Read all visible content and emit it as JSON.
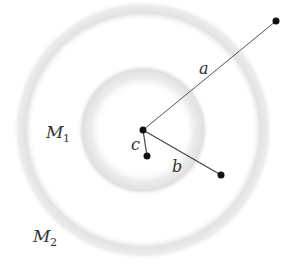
{
  "diagram": {
    "center": {
      "x": 143,
      "y": 130
    },
    "shells": [
      {
        "id": "M1",
        "radius": 52,
        "thickness": 22,
        "label": "M",
        "subscript": "1",
        "label_x": 47,
        "label_y": 138
      },
      {
        "id": "M2",
        "radius": 117,
        "thickness": 18,
        "label": "M",
        "subscript": "2",
        "label_x": 34,
        "label_y": 242
      }
    ],
    "points": [
      {
        "name": "a",
        "x": 276,
        "y": 21,
        "label": "a",
        "label_x": 200,
        "label_y": 73
      },
      {
        "name": "b",
        "x": 221,
        "y": 175,
        "label": "b",
        "label_x": 172,
        "label_y": 171
      },
      {
        "name": "c",
        "x": 147,
        "y": 156,
        "label": "c",
        "label_x": 131,
        "label_y": 150
      }
    ],
    "colors": {
      "shell": "#e6e6e6",
      "line": "#444444",
      "point": "#111111"
    }
  }
}
